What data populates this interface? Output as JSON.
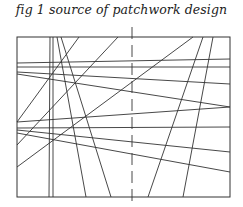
{
  "figure": {
    "caption": "fig 1 source of patchwork design",
    "frame": {
      "x1": 17,
      "y1": 37,
      "x2": 230,
      "y2": 197
    },
    "center_line": {
      "x": 132,
      "y1": 27,
      "y2": 206,
      "dash": "12,6"
    },
    "line_color": "#333333",
    "lines": [
      [
        50,
        37,
        49,
        197
      ],
      [
        53,
        37,
        53,
        197
      ],
      [
        57,
        37,
        86,
        197
      ],
      [
        61,
        37,
        111,
        197
      ],
      [
        203,
        37,
        148,
        197
      ],
      [
        213,
        37,
        183,
        197
      ],
      [
        79,
        37,
        17,
        122
      ],
      [
        118,
        37,
        17,
        145
      ],
      [
        193,
        37,
        17,
        167
      ],
      [
        17,
        63,
        230,
        59
      ],
      [
        17,
        67,
        230,
        67
      ],
      [
        17,
        72,
        230,
        84
      ],
      [
        17,
        74,
        230,
        107
      ],
      [
        17,
        122,
        230,
        107
      ],
      [
        17,
        128,
        230,
        127
      ],
      [
        17,
        130,
        230,
        152
      ],
      [
        17,
        133,
        230,
        172
      ]
    ]
  }
}
